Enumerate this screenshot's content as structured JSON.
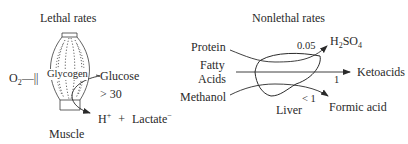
{
  "left_panel": {
    "title": "Lethal rates",
    "organ_label": "Muscle",
    "oxygen": {
      "base": "O",
      "sub": "2",
      "symbol": "—||"
    },
    "store_label": "Glycogen",
    "input_label": "Glucose",
    "rate": "> 30",
    "product": {
      "h": "H",
      "h_sup": "+",
      "plus": "+",
      "lactate": "Lactate",
      "lactate_sup": "−"
    }
  },
  "right_panel": {
    "title": "Nonlethal rates",
    "organ_label": "Liver",
    "inputs": {
      "protein": "Protein",
      "fatty_1": "Fatty",
      "fatty_2": "Acids",
      "methanol": "Methanol"
    },
    "rates": {
      "protein": "0.05",
      "fatty": "1",
      "methanol": "< 1"
    },
    "outputs": {
      "sulfuric": {
        "a": "H",
        "a_sub": "2",
        "b": "SO",
        "b_sub": "4"
      },
      "ketoacids": "Ketoacids",
      "formic": "Formic acid"
    }
  },
  "colors": {
    "ink": "#2a2a2a",
    "background": "#ffffff"
  }
}
